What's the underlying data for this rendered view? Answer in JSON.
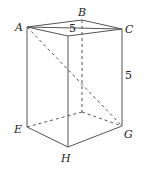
{
  "diagram": {
    "type": "rectangular-prism",
    "vertices": {
      "A": "A",
      "B": "B",
      "C": "C",
      "E": "E",
      "G": "G",
      "H": "H"
    },
    "edge_labels": {
      "top": "5",
      "height": "5"
    },
    "visible_edges": [
      "A-B",
      "B-C",
      "A-D",
      "D-C",
      "A-E",
      "D-H",
      "C-G",
      "E-H",
      "H-G"
    ],
    "hidden_edges": [
      "B-F",
      "E-F",
      "F-G",
      "A-G"
    ]
  }
}
